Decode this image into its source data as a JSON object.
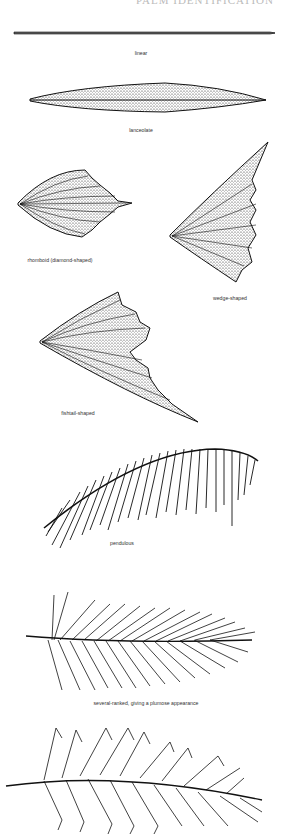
{
  "page": {
    "header_partial": "PALM IDENTIFICATION"
  },
  "figures": [
    {
      "id": "linear",
      "caption": "linear"
    },
    {
      "id": "lanceolate",
      "caption": "lanceolate"
    },
    {
      "id": "rhomboid",
      "caption": "rhomboid (diamond-shaped)"
    },
    {
      "id": "wedge",
      "caption": "wedge-shaped"
    },
    {
      "id": "fishtail",
      "caption": "fishtail-shaped"
    },
    {
      "id": "pendulous",
      "caption": "pendulous"
    },
    {
      "id": "plumose",
      "caption": "several-ranked, giving a plumose appearance"
    },
    {
      "id": "reduplicate",
      "caption": ""
    }
  ],
  "colors": {
    "ink": "#1a1a1a",
    "background": "#ffffff"
  }
}
